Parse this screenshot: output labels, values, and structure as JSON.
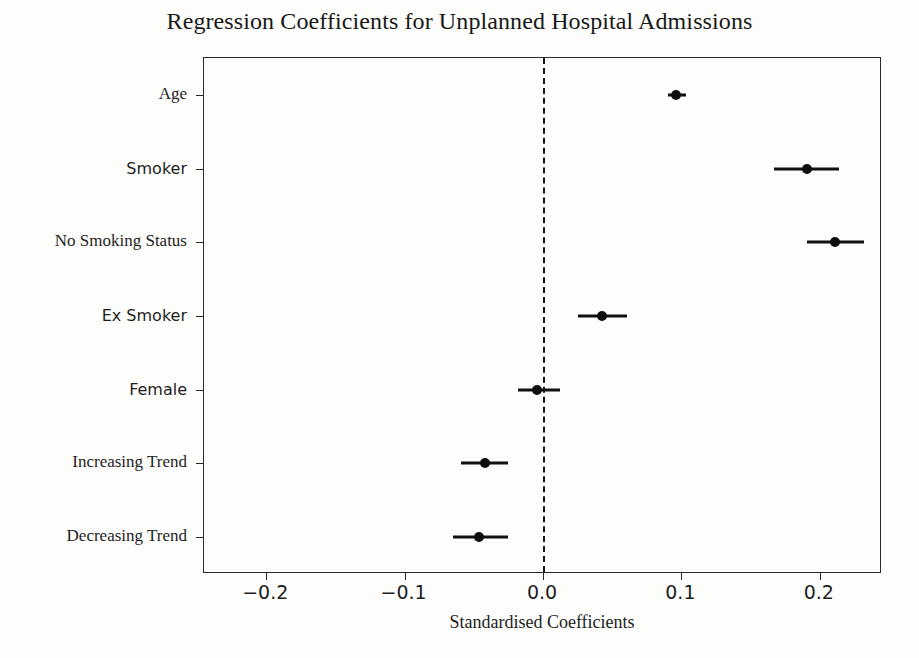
{
  "chart_data": {
    "type": "scatter",
    "subtype": "forest-plot",
    "title": "Regression Coefficients for Unplanned Hospital Admissions",
    "xlabel": "Standardised Coefficients",
    "ylabel": "",
    "xlim": [
      -0.245,
      0.245
    ],
    "xticks": [
      -0.2,
      -0.1,
      0.0,
      0.1,
      0.2
    ],
    "xticklabels": [
      "−0.2",
      "−0.1",
      "0.0",
      "0.1",
      "0.2"
    ],
    "grid": false,
    "legend": null,
    "reference_line": {
      "x": 0.0,
      "style": "dashed",
      "color": "#151515"
    },
    "categories": [
      "Age",
      "Smoker",
      "No Smoking Status",
      "Ex Smoker",
      "Female",
      "Increasing Trend",
      "Decreasing Trend"
    ],
    "values": [
      0.096,
      0.191,
      0.211,
      0.043,
      -0.004,
      -0.042,
      -0.046
    ],
    "ci_low": [
      0.09,
      0.167,
      0.191,
      0.025,
      -0.018,
      -0.059,
      -0.065
    ],
    "ci_high": [
      0.103,
      0.214,
      0.232,
      0.061,
      0.012,
      -0.025,
      -0.025
    ],
    "points": [
      {
        "label": "Age",
        "value": 0.096,
        "ci_low": 0.09,
        "ci_high": 0.103
      },
      {
        "label": "Smoker",
        "value": 0.191,
        "ci_low": 0.167,
        "ci_high": 0.214
      },
      {
        "label": "No Smoking Status",
        "value": 0.211,
        "ci_low": 0.191,
        "ci_high": 0.232
      },
      {
        "label": "Ex Smoker",
        "value": 0.043,
        "ci_low": 0.025,
        "ci_high": 0.061
      },
      {
        "label": "Female",
        "value": -0.004,
        "ci_low": -0.018,
        "ci_high": 0.012
      },
      {
        "label": "Increasing Trend",
        "value": -0.042,
        "ci_low": -0.059,
        "ci_high": -0.025
      },
      {
        "label": "Decreasing Trend",
        "value": -0.046,
        "ci_low": -0.065,
        "ci_high": -0.025
      }
    ],
    "label_fonts": [
      "serif",
      "sans",
      "serif",
      "sans",
      "sans",
      "serif",
      "serif"
    ],
    "colors": {
      "marker": "#0d0d0d",
      "error_bar": "#111111",
      "axis": "#2a2a2a",
      "reference": "#151515",
      "background": "#fdfdfc",
      "text": "#1d1d1d"
    }
  }
}
